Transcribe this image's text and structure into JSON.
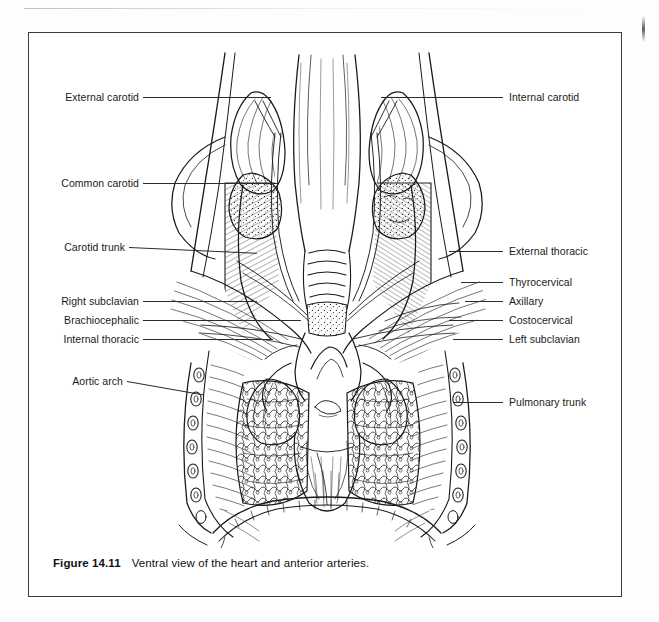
{
  "figure": {
    "number": "Figure 14.11",
    "caption": "Ventral view of the heart and anterior arteries."
  },
  "labels": {
    "left": [
      {
        "text": "External carotid",
        "name": "label-external-carotid"
      },
      {
        "text": "Common carotid",
        "name": "label-common-carotid"
      },
      {
        "text": "Carotid trunk",
        "name": "label-carotid-trunk"
      },
      {
        "text": "Right subclavian",
        "name": "label-right-subclavian"
      },
      {
        "text": "Brachiocephalic",
        "name": "label-brachiocephalic"
      },
      {
        "text": "Internal thoracic",
        "name": "label-internal-thoracic"
      },
      {
        "text": "Aortic arch",
        "name": "label-aortic-arch"
      }
    ],
    "right": [
      {
        "text": "Internal carotid",
        "name": "label-internal-carotid"
      },
      {
        "text": "External thoracic",
        "name": "label-external-thoracic"
      },
      {
        "text": "Thyrocervical",
        "name": "label-thyrocervical"
      },
      {
        "text": "Axillary",
        "name": "label-axillary"
      },
      {
        "text": "Costocervical",
        "name": "label-costocervical"
      },
      {
        "text": "Left subclavian",
        "name": "label-left-subclavian"
      },
      {
        "text": "Pulmonary trunk",
        "name": "label-pulmonary-trunk"
      }
    ]
  },
  "colors": {
    "ink": "#1a1a1a",
    "frame": "#3b3b3b",
    "paper": "#ffffff",
    "page": "#fdfdfd"
  }
}
